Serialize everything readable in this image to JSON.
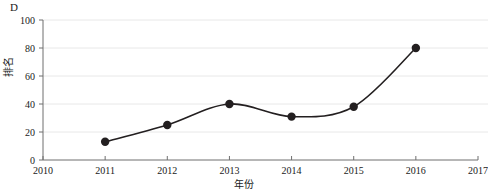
{
  "figure": {
    "panel_label": "D",
    "background_color": "#ffffff"
  },
  "chart_data": {
    "type": "line",
    "title": "",
    "subtitle": "",
    "xlabel": "年份",
    "ylabel": "排名",
    "x": [
      2011,
      2012,
      2013,
      2014,
      2015,
      2016
    ],
    "values": [
      13,
      25,
      40,
      31,
      38,
      80
    ],
    "series": [
      {
        "name": "排名",
        "x": [
          2011,
          2012,
          2013,
          2014,
          2015,
          2016
        ],
        "values": [
          13,
          25,
          40,
          31,
          38,
          80
        ],
        "line_color": "#231f20",
        "marker_color": "#231f20",
        "marker": "circle",
        "smooth": true
      }
    ],
    "xlim": [
      2010,
      2017
    ],
    "ylim": [
      0,
      100
    ],
    "xticks": [
      2010,
      2011,
      2012,
      2013,
      2014,
      2015,
      2016,
      2017
    ],
    "xtick_labels": [
      "2010",
      "2011",
      "2012",
      "2013",
      "2014",
      "2015",
      "2016",
      "2017"
    ],
    "yticks": [
      0,
      20,
      40,
      60,
      80,
      100
    ],
    "ytick_labels": [
      "0",
      "20",
      "40",
      "60",
      "80",
      "100"
    ],
    "grid": {
      "horizontal": true,
      "vertical": false,
      "color": "#e8e8e8"
    },
    "legend": {
      "visible": false,
      "position": "none"
    },
    "axis_color": "#6f6f6f",
    "annotations": []
  }
}
